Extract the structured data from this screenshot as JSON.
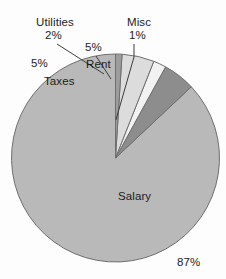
{
  "chart_data": {
    "type": "pie",
    "title": "",
    "subtitle": "",
    "xlabel": "",
    "ylabel": "",
    "legend_position": "none",
    "grid": false,
    "labels_inside": true,
    "categories": [
      "Salary",
      "Taxes",
      "Utilities",
      "Rent",
      "Misc"
    ],
    "values": [
      87,
      5,
      2,
      5,
      1
    ],
    "unit": "%",
    "start_angle_deg": 90,
    "direction": "counterclockwise",
    "slices": [
      {
        "label": "Salary",
        "value": 87,
        "percent_text": "87%",
        "color": "#b9b9b9",
        "label_placement": "inside"
      },
      {
        "label": "Taxes",
        "value": 5,
        "percent_text": "5%",
        "color": "#8d8d8d",
        "label_placement": "inside"
      },
      {
        "label": "Utilities",
        "value": 2,
        "percent_text": "2%",
        "color": "#f2f2f2",
        "label_placement": "outside-leader"
      },
      {
        "label": "Rent",
        "value": 5,
        "percent_text": "5%",
        "color": "#dcdcdc",
        "label_placement": "inside"
      },
      {
        "label": "Misc",
        "value": 1,
        "percent_text": "1%",
        "color": "#9d9d9d",
        "label_placement": "outside-leader"
      }
    ]
  },
  "chart": {
    "title": "",
    "background_color": "#fdfdfd",
    "outline_color": "#6f6f6f",
    "leader_line_color": "#3c3c3c",
    "center": {
      "x": 115.5,
      "y": 158
    },
    "radius": 104
  },
  "labels": {
    "utilities": {
      "name": "Utilities",
      "percent": "2%"
    },
    "misc": {
      "name": "Misc",
      "percent": "1%"
    },
    "rent": {
      "name": "Rent",
      "percent": "5%"
    },
    "taxes": {
      "name": "Taxes",
      "percent": "5%"
    },
    "salary": {
      "name": "Salary",
      "percent": "87%"
    }
  }
}
